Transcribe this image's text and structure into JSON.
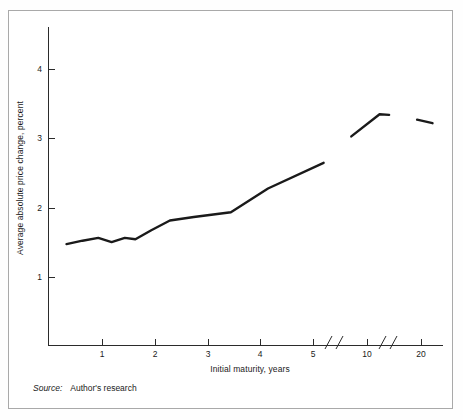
{
  "figure": {
    "source_label": "Source:",
    "source_text": "Author's research",
    "border_color": "#a9a9a9",
    "line_color": "#1a1a1a",
    "background": "#ffffff"
  },
  "chart_data": {
    "type": "line",
    "title": "",
    "xlabel": "Initial maturity, years",
    "ylabel": "Average absolute price change, percent",
    "ylim": [
      0,
      4.6
    ],
    "yticks": [
      1,
      2,
      3,
      4
    ],
    "ytick_labels": [
      "1",
      "2",
      "3",
      "4"
    ],
    "xticks": [
      1,
      2,
      3,
      4,
      5,
      10,
      20
    ],
    "xtick_labels": [
      "1",
      "2",
      "3",
      "4",
      "5",
      "10",
      "20"
    ],
    "grid": false,
    "legend": null,
    "axis_breaks": [
      {
        "after_tick": "5",
        "glyph": "//"
      },
      {
        "after_tick": "10",
        "glyph": "//"
      }
    ],
    "series": [
      {
        "name": "Average absolute price change",
        "segment": "short-maturity",
        "x": [
          0.35,
          0.65,
          0.95,
          1.2,
          1.45,
          1.65,
          1.95,
          2.3,
          2.75,
          3.45,
          4.15,
          5.2
        ],
        "y": [
          1.48,
          1.53,
          1.57,
          1.51,
          1.57,
          1.55,
          1.68,
          1.82,
          1.87,
          1.94,
          2.28,
          2.65
        ]
      },
      {
        "name": "Average absolute price change",
        "segment": "mid-maturity",
        "x": [
          8.8,
          10.9,
          11.6
        ],
        "y": [
          3.03,
          3.35,
          3.34
        ]
      },
      {
        "name": "Average absolute price change",
        "segment": "long-maturity",
        "x": [
          19.2,
          22.0
        ],
        "y": [
          3.27,
          3.22
        ]
      }
    ]
  }
}
